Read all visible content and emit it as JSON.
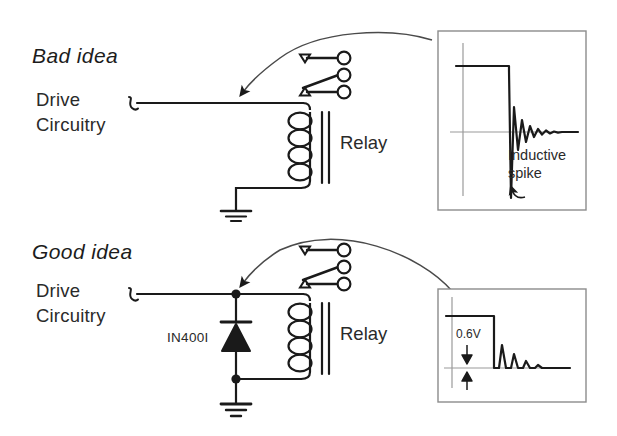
{
  "figure": {
    "background": "#ffffff",
    "ink": "#1a1a1a",
    "inset_border": "#8c8c8c",
    "axis_gray": "#9a9a9a"
  },
  "sections": [
    {
      "id": "bad",
      "title": "Bad idea",
      "drive_line1": "Drive",
      "drive_line2": "Circuitry",
      "relay_label": "Relay",
      "has_diode": false,
      "diode_label": "",
      "annotation_line1": "Inductive",
      "annotation_line2": "spike",
      "coil_turns": 4,
      "contact_terminals": 3
    },
    {
      "id": "good",
      "title": "Good idea",
      "drive_line1": "Drive",
      "drive_line2": "Circuitry",
      "relay_label": "Relay",
      "has_diode": true,
      "diode_label": "IN400I",
      "annotation_line1": "0.6V",
      "annotation_line2": "",
      "coil_turns": 4,
      "contact_terminals": 3
    }
  ],
  "insets": [
    {
      "id": "bad-scope",
      "caption_line1": "Inductive",
      "caption_line2": "spike",
      "waveform_description": "square pulse falling to large negative inductive spike with damped ringing"
    },
    {
      "id": "good-scope",
      "measurement": "0.6V",
      "waveform_description": "square pulse falling with small clamped overshoot and damped ringing"
    }
  ],
  "icons": {
    "ground": "ground-symbol",
    "diode": "diode-symbol",
    "coil": "inductor-coil",
    "junction": "junction-dot",
    "arrow": "curved-pointer-arrow",
    "armature": "relay-armature-bar",
    "terminal": "contact-terminal"
  }
}
